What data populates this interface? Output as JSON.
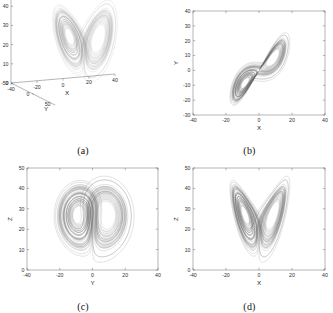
{
  "figure": {
    "background": "#ffffff",
    "trace_color": "#666666",
    "axis_color": "#6b6b6b"
  },
  "captions": {
    "a": "(a)",
    "b": "(b)",
    "c": "(c)",
    "d": "(d)"
  },
  "chart_data": [
    {
      "id": "panel-a",
      "type": "line",
      "title": "(a)",
      "projection": "3d",
      "xlabel": "X",
      "ylabel": "Y",
      "zlabel": "Z",
      "xlim": [
        -40,
        40
      ],
      "ylim": [
        -50,
        50
      ],
      "zlim": [
        0,
        50
      ],
      "xticks": [
        -40,
        -20,
        0,
        20,
        40
      ],
      "yticks": [
        -50,
        0,
        50
      ],
      "zticks": [
        0,
        10,
        20,
        30,
        40,
        50
      ],
      "xticklabels": [
        "-40",
        "-20",
        "0",
        "20",
        "40"
      ],
      "yticklabels": [
        "-50",
        "0",
        "50"
      ],
      "zticklabels": [
        "0",
        "10",
        "20",
        "30",
        "40",
        "50"
      ],
      "grid": false,
      "legend": "none",
      "series": [
        {
          "name": "trajectory",
          "description": "3-D double-scroll butterfly attractor viewed in X-Y-Z space"
        }
      ]
    },
    {
      "id": "panel-b",
      "type": "line",
      "title": "(b)",
      "projection": "x-y",
      "xlabel": "X",
      "ylabel": "Y",
      "xlim": [
        -40,
        40
      ],
      "ylim": [
        -30,
        40
      ],
      "xticks": [
        -40,
        -20,
        0,
        20,
        40
      ],
      "yticks": [
        -30,
        -20,
        -10,
        0,
        10,
        20,
        30,
        40
      ],
      "xticklabels": [
        "-40",
        "-20",
        "0",
        "20",
        "40"
      ],
      "yticklabels": [
        "-30",
        "-20",
        "-10",
        "0",
        "10",
        "20",
        "30",
        "40"
      ],
      "grid": false,
      "legend": "none",
      "series": [
        {
          "name": "trajectory",
          "description": "Elongated diagonal band of orbits from lower-left to upper-right"
        }
      ]
    },
    {
      "id": "panel-c",
      "type": "line",
      "title": "(c)",
      "projection": "y-z",
      "xlabel": "Y",
      "ylabel": "Z",
      "xlim": [
        -40,
        40
      ],
      "ylim": [
        0,
        50
      ],
      "xticks": [
        -40,
        -20,
        0,
        20,
        40
      ],
      "yticks": [
        0,
        10,
        20,
        30,
        40,
        50
      ],
      "xticklabels": [
        "-40",
        "-20",
        "0",
        "20",
        "40"
      ],
      "yticklabels": [
        "0",
        "10",
        "20",
        "30",
        "40",
        "50"
      ],
      "grid": false,
      "legend": "none",
      "series": [
        {
          "name": "trajectory",
          "description": "Two nested spiral lobes centred near Y=-9 and Y=9 at Z=22"
        }
      ]
    },
    {
      "id": "panel-d",
      "type": "line",
      "title": "(d)",
      "projection": "x-z",
      "xlabel": "X",
      "ylabel": "Z",
      "xlim": [
        -40,
        40
      ],
      "ylim": [
        0,
        50
      ],
      "xticks": [
        -40,
        -20,
        0,
        20,
        40
      ],
      "yticks": [
        0,
        10,
        20,
        30,
        40,
        50
      ],
      "xticklabels": [
        "-40",
        "-20",
        "0",
        "20",
        "40"
      ],
      "yticklabels": [
        "0",
        "10",
        "20",
        "30",
        "40",
        "50"
      ],
      "grid": false,
      "legend": "none",
      "series": [
        {
          "name": "trajectory",
          "description": "Butterfly wings with spiral cores near X=-10 and X=9 at Z=22"
        }
      ]
    }
  ],
  "system": {
    "name": "lorenz-like",
    "sigma": 10,
    "rho": 28,
    "beta": 2.6667,
    "dt": 0.006,
    "steps": 9000,
    "init": [
      0.6,
      0.4,
      12.0
    ]
  }
}
